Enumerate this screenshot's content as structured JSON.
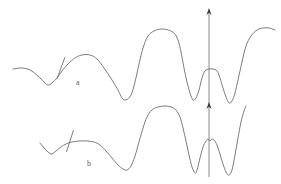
{
  "figure": {
    "background_color": "#ffffff",
    "line_color": "#6d6d6d",
    "arrow_color": "#3a3a3a",
    "width": 281,
    "height": 184,
    "labels": {
      "trace_a": "a",
      "trace_b": "b"
    },
    "label_positions": {
      "trace_a": {
        "x": 76,
        "y": 85
      },
      "trace_b": {
        "x": 87,
        "y": 166
      }
    }
  },
  "chart_data": {
    "type": "line",
    "title": "",
    "subtitle": "",
    "xlabel": "",
    "ylabel": "",
    "grid": false,
    "legend_position": "inline-annotation",
    "axes_visible": false,
    "xlim": [
      0,
      281
    ],
    "ylim": [
      184,
      0
    ],
    "series": [
      {
        "name": "a",
        "label": "a",
        "color": "#6d6d6d",
        "points": [
          [
            13,
            69
          ],
          [
            22,
            68
          ],
          [
            30,
            70
          ],
          [
            38,
            76
          ],
          [
            44,
            82
          ],
          [
            48,
            85
          ],
          [
            52,
            83
          ],
          [
            57,
            78
          ],
          [
            62,
            71
          ],
          [
            68,
            64
          ],
          [
            75,
            58
          ],
          [
            82,
            55
          ],
          [
            90,
            55
          ],
          [
            97,
            59
          ],
          [
            104,
            68
          ],
          [
            112,
            80
          ],
          [
            118,
            90
          ],
          [
            122,
            98
          ],
          [
            126,
            100
          ],
          [
            131,
            95
          ],
          [
            135,
            82
          ],
          [
            139,
            64
          ],
          [
            143,
            48
          ],
          [
            148,
            36
          ],
          [
            154,
            31
          ],
          [
            161,
            29
          ],
          [
            168,
            30
          ],
          [
            174,
            33
          ],
          [
            178,
            40
          ],
          [
            181,
            52
          ],
          [
            184,
            68
          ],
          [
            187,
            82
          ],
          [
            190,
            93
          ],
          [
            193,
            100
          ],
          [
            196,
            98
          ],
          [
            199,
            90
          ],
          [
            202,
            78
          ],
          [
            205,
            71
          ],
          [
            209,
            69
          ],
          [
            213,
            69
          ],
          [
            217,
            71
          ],
          [
            220,
            78
          ],
          [
            223,
            88
          ],
          [
            226,
            97
          ],
          [
            229,
            103
          ],
          [
            232,
            101
          ],
          [
            235,
            93
          ],
          [
            238,
            80
          ],
          [
            242,
            62
          ],
          [
            246,
            46
          ],
          [
            251,
            36
          ],
          [
            257,
            30
          ],
          [
            263,
            28
          ],
          [
            269,
            28
          ],
          [
            275,
            30
          ]
        ],
        "annotations": [
          {
            "type": "tick",
            "x": 61,
            "y": 68,
            "angle": 20
          }
        ]
      },
      {
        "name": "b",
        "label": "b",
        "color": "#6d6d6d",
        "points": [
          [
            40,
            143
          ],
          [
            44,
            148
          ],
          [
            48,
            152
          ],
          [
            52,
            154
          ],
          [
            56,
            151
          ],
          [
            61,
            147
          ],
          [
            66,
            144
          ],
          [
            72,
            142
          ],
          [
            79,
            141
          ],
          [
            87,
            141
          ],
          [
            94,
            142
          ],
          [
            100,
            145
          ],
          [
            106,
            151
          ],
          [
            112,
            158
          ],
          [
            118,
            165
          ],
          [
            123,
            169
          ],
          [
            127,
            170
          ],
          [
            131,
            166
          ],
          [
            135,
            156
          ],
          [
            139,
            142
          ],
          [
            143,
            128
          ],
          [
            147,
            117
          ],
          [
            152,
            110
          ],
          [
            158,
            107
          ],
          [
            165,
            106
          ],
          [
            171,
            107
          ],
          [
            176,
            110
          ],
          [
            180,
            117
          ],
          [
            183,
            128
          ],
          [
            186,
            141
          ],
          [
            189,
            155
          ],
          [
            192,
            167
          ],
          [
            195,
            173
          ],
          [
            197,
            170
          ],
          [
            200,
            158
          ],
          [
            203,
            147
          ],
          [
            206,
            141
          ],
          [
            208,
            139
          ],
          [
            210,
            141
          ],
          [
            212,
            139
          ],
          [
            214,
            140
          ],
          [
            217,
            145
          ],
          [
            220,
            154
          ],
          [
            223,
            164
          ],
          [
            226,
            172
          ],
          [
            229,
            175
          ],
          [
            232,
            170
          ],
          [
            235,
            155
          ],
          [
            238,
            138
          ],
          [
            241,
            122
          ],
          [
            244,
            111
          ],
          [
            246,
            106
          ]
        ],
        "annotations": [
          {
            "type": "tick",
            "x": 70,
            "y": 141,
            "angle": 18
          }
        ]
      }
    ],
    "arrows": [
      {
        "name": "upper-arrow",
        "x": 209,
        "y_tail": 107,
        "y_head": 8,
        "direction": "up"
      },
      {
        "name": "lower-arrow",
        "x": 209,
        "y_tail": 177,
        "y_head": 102,
        "direction": "up"
      }
    ]
  }
}
